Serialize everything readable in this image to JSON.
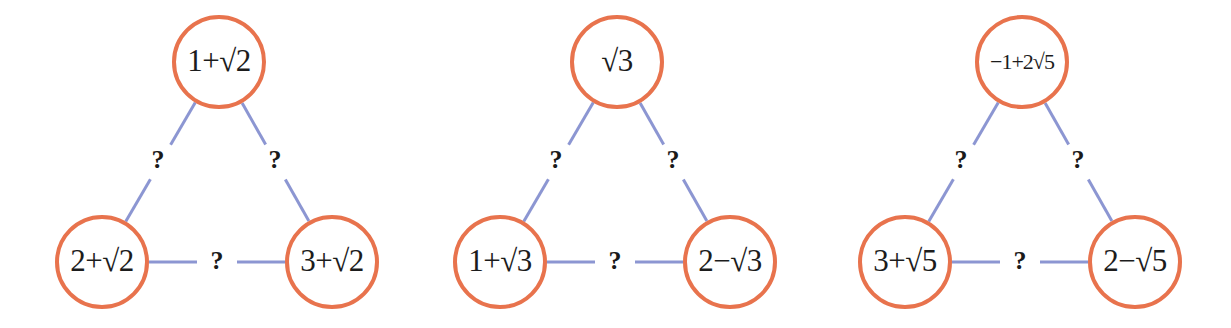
{
  "canvas": {
    "width": 1231,
    "height": 328,
    "background": "#ffffff"
  },
  "style": {
    "node_stroke_color": "#E8734D",
    "node_stroke_width": 4,
    "node_fill": "#ffffff",
    "node_radius": 45,
    "edge_color": "#8C96D2",
    "edge_width": 3,
    "label_color": "#1c1c1c",
    "edge_label_color": "#1a1a1a"
  },
  "diagrams": [
    {
      "id": "diagram-1",
      "name": "sqrt2-triangle",
      "nodes": [
        {
          "id": "top",
          "label": "1+√2",
          "cx": 219,
          "cy": 62,
          "r": 45,
          "font_size": 31
        },
        {
          "id": "bottom-left",
          "label": "2+√2",
          "cx": 102,
          "cy": 262,
          "r": 45,
          "font_size": 31
        },
        {
          "id": "bottom-right",
          "label": "3+√2",
          "cx": 332,
          "cy": 262,
          "r": 45,
          "font_size": 31
        }
      ],
      "edges": [
        {
          "id": "edge-top-left",
          "from": "top",
          "to": "bottom-left",
          "label": "?",
          "lx": 158,
          "ly": 161
        },
        {
          "id": "edge-top-right",
          "from": "top",
          "to": "bottom-right",
          "label": "?",
          "lx": 275,
          "ly": 161
        },
        {
          "id": "edge-bottom",
          "from": "bottom-left",
          "to": "bottom-right",
          "label": "?",
          "lx": 217,
          "ly": 262
        }
      ]
    },
    {
      "id": "diagram-2",
      "name": "sqrt3-triangle",
      "nodes": [
        {
          "id": "top",
          "label": "√3",
          "cx": 617,
          "cy": 62,
          "r": 45,
          "font_size": 31
        },
        {
          "id": "bottom-left",
          "label": "1+√3",
          "cx": 500,
          "cy": 262,
          "r": 45,
          "font_size": 31
        },
        {
          "id": "bottom-right",
          "label": "2−√3",
          "cx": 730,
          "cy": 262,
          "r": 45,
          "font_size": 31
        }
      ],
      "edges": [
        {
          "id": "edge-top-left",
          "from": "top",
          "to": "bottom-left",
          "label": "?",
          "lx": 556,
          "ly": 161
        },
        {
          "id": "edge-top-right",
          "from": "top",
          "to": "bottom-right",
          "label": "?",
          "lx": 673,
          "ly": 161
        },
        {
          "id": "edge-bottom",
          "from": "bottom-left",
          "to": "bottom-right",
          "label": "?",
          "lx": 615,
          "ly": 262
        }
      ]
    },
    {
      "id": "diagram-3",
      "name": "sqrt5-triangle",
      "nodes": [
        {
          "id": "top",
          "label": "−1+2√5",
          "cx": 1022,
          "cy": 62,
          "r": 45,
          "font_size": 22
        },
        {
          "id": "bottom-left",
          "label": "3+√5",
          "cx": 905,
          "cy": 262,
          "r": 45,
          "font_size": 31
        },
        {
          "id": "bottom-right",
          "label": "2−√5",
          "cx": 1135,
          "cy": 262,
          "r": 45,
          "font_size": 31
        }
      ],
      "edges": [
        {
          "id": "edge-top-left",
          "from": "top",
          "to": "bottom-left",
          "label": "?",
          "lx": 961,
          "ly": 161
        },
        {
          "id": "edge-top-right",
          "from": "top",
          "to": "bottom-right",
          "label": "?",
          "lx": 1078,
          "ly": 161
        },
        {
          "id": "edge-bottom",
          "from": "bottom-left",
          "to": "bottom-right",
          "label": "?",
          "lx": 1020,
          "ly": 262
        }
      ]
    }
  ]
}
